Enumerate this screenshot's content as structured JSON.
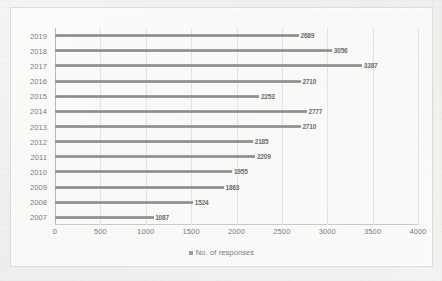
{
  "chart_data": {
    "type": "bar",
    "orientation": "horizontal",
    "title": "",
    "subtitle": "",
    "xlabel": "",
    "ylabel": "",
    "categories": [
      "2019",
      "2018",
      "2017",
      "2016",
      "2015",
      "2014",
      "2013",
      "2012",
      "2011",
      "2010",
      "2009",
      "2008",
      "2007"
    ],
    "values": [
      2689,
      3056,
      3387,
      2710,
      2253,
      2777,
      2710,
      2185,
      2209,
      1955,
      1863,
      1524,
      1087
    ],
    "series": [
      {
        "name": "No. of responses",
        "values": [
          2689,
          3056,
          3387,
          2710,
          2253,
          2777,
          2710,
          2185,
          2209,
          1955,
          1863,
          1524,
          1087
        ]
      }
    ],
    "data_labels": [
      "2689",
      "3056",
      "3387",
      "2710",
      "2253",
      "2777",
      "2710",
      "2185",
      "2209",
      "1955",
      "1863",
      "1524",
      "1087"
    ],
    "xlim": [
      0,
      4000
    ],
    "xticks": [
      0,
      500,
      1000,
      1500,
      2000,
      2500,
      3000,
      3500,
      4000
    ],
    "xticklabels": [
      "0",
      "500",
      "1000",
      "1500",
      "2000",
      "2500",
      "3000",
      "3500",
      "4000"
    ],
    "grid": "vertical",
    "legend": {
      "position": "bottom-center",
      "entries": [
        {
          "label": "No. of responses",
          "marker": "square-marker",
          "color": "#9a9a98"
        }
      ]
    },
    "colors": {
      "bar": "#9a9a98",
      "grid": "#e3e3e1",
      "axis": "#b8b8b6",
      "text": "#7b7b79",
      "data_label": "#6d6d6b",
      "plot_background": "#ffffff",
      "page_background": "#f2f2f0",
      "frame_border": "#dcdcd8"
    }
  }
}
